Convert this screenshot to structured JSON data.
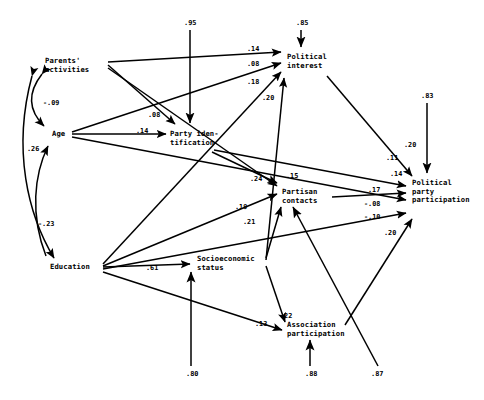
{
  "figure": {
    "type": "path-diagram",
    "title": "",
    "background_color": "#ffffff",
    "line_color": "#000000",
    "text_color": "#000000"
  },
  "nodes": [
    {
      "id": "parents_activities",
      "label": "Parents'\nactivities",
      "x": 45,
      "y": 58
    },
    {
      "id": "age",
      "label": "Age",
      "x": 52,
      "y": 131
    },
    {
      "id": "education",
      "label": "Education",
      "x": 50,
      "y": 264
    },
    {
      "id": "party_identification",
      "label": "Party iden-\ntification",
      "x": 168,
      "y": 131
    },
    {
      "id": "political_interest",
      "label": "Political\ninterest",
      "x": 287,
      "y": 54
    },
    {
      "id": "partisan_contacts",
      "label": "Partisan\ncontacts",
      "x": 281,
      "y": 189
    },
    {
      "id": "socioeconomic_status",
      "label": "Socioeconomic\nstatus",
      "x": 196,
      "y": 255
    },
    {
      "id": "association_participation",
      "label": "Association\nparticipation",
      "x": 286,
      "y": 322
    },
    {
      "id": "political_party_participation",
      "label": "Political\nparty\nparticipation",
      "x": 411,
      "y": 180
    }
  ],
  "coefficients": [
    {
      "id": "c-parents-interest",
      "value": ".14",
      "x": 247,
      "y": 47
    },
    {
      "id": "c-age-interest",
      "value": ".08",
      "x": 247,
      "y": 62
    },
    {
      "id": "c-education-interest",
      "value": ".18",
      "x": 247,
      "y": 80
    },
    {
      "id": "c-ses-interest",
      "value": ".20",
      "x": 262,
      "y": 96
    },
    {
      "id": "c-parents-partyid",
      "value": ".08",
      "x": 148,
      "y": 113
    },
    {
      "id": "c-age-partyid",
      "value": ".14",
      "x": 136,
      "y": 129
    },
    {
      "id": "c-partyid-contacts",
      "value": ".24",
      "x": 250,
      "y": 177
    },
    {
      "id": "c-parents-contacts",
      "value": ".15",
      "x": 286,
      "y": 174
    },
    {
      "id": "c-education-contacts",
      "value": ".19",
      "x": 235,
      "y": 205
    },
    {
      "id": "c-ses-contacts",
      "value": ".21",
      "x": 243,
      "y": 220
    },
    {
      "id": "c-education-ses",
      "value": ".61",
      "x": 146,
      "y": 266
    },
    {
      "id": "c-ses-assoc",
      "value": ".22",
      "x": 280,
      "y": 314
    },
    {
      "id": "c-education-assoc",
      "value": ".13",
      "x": 255,
      "y": 322
    },
    {
      "id": "c-interest-ppp",
      "value": ".20",
      "x": 404,
      "y": 143
    },
    {
      "id": "c-partyid-ppp",
      "value": ".11",
      "x": 386,
      "y": 156
    },
    {
      "id": "c-contacts-ppp-a",
      "value": ".14",
      "x": 390,
      "y": 172
    },
    {
      "id": "c-contacts-ppp-b",
      "value": ".17",
      "x": 368,
      "y": 188
    },
    {
      "id": "c-age-ppp",
      "value": "-.08",
      "x": 364,
      "y": 202
    },
    {
      "id": "c-education-ppp",
      "value": "-.10",
      "x": 364,
      "y": 215
    },
    {
      "id": "c-assoc-ppp",
      "value": ".20",
      "x": 384,
      "y": 231
    },
    {
      "id": "corr-parents-age",
      "value": "-.09",
      "x": 43,
      "y": 101
    },
    {
      "id": "corr-age-education",
      "value": ".26",
      "x": 27,
      "y": 147
    },
    {
      "id": "corr-parents-education",
      "value": "-.23",
      "x": 38,
      "y": 222
    }
  ],
  "disturbances": [
    {
      "id": "d-partyid",
      "value": ".95",
      "x": 184,
      "y": 21
    },
    {
      "id": "d-interest",
      "value": ".85",
      "x": 296,
      "y": 21
    },
    {
      "id": "d-ppp",
      "value": ".83",
      "x": 421,
      "y": 94
    },
    {
      "id": "d-ses",
      "value": ".80",
      "x": 186,
      "y": 372
    },
    {
      "id": "d-assoc",
      "value": ".88",
      "x": 305,
      "y": 372
    },
    {
      "id": "d-contacts",
      "value": ".87",
      "x": 371,
      "y": 372
    }
  ],
  "edges": [
    {
      "id": "e-parents-interest",
      "from": "parents_activities",
      "to": "political_interest",
      "coef": ".14"
    },
    {
      "id": "e-age-interest",
      "from": "age",
      "to": "political_interest",
      "coef": ".08"
    },
    {
      "id": "e-education-interest",
      "from": "education",
      "to": "political_interest",
      "coef": ".18"
    },
    {
      "id": "e-ses-interest",
      "from": "socioeconomic_status",
      "to": "political_interest",
      "coef": ".20"
    },
    {
      "id": "e-parents-partyid",
      "from": "parents_activities",
      "to": "party_identification",
      "coef": ".08"
    },
    {
      "id": "e-age-partyid",
      "from": "age",
      "to": "party_identification",
      "coef": ".14"
    },
    {
      "id": "e-partyid-contacts",
      "from": "party_identification",
      "to": "partisan_contacts",
      "coef": ".24"
    },
    {
      "id": "e-parents-contacts",
      "from": "parents_activities",
      "to": "partisan_contacts",
      "coef": ".15"
    },
    {
      "id": "e-education-contacts",
      "from": "education",
      "to": "partisan_contacts",
      "coef": ".19"
    },
    {
      "id": "e-ses-contacts",
      "from": "socioeconomic_status",
      "to": "partisan_contacts",
      "coef": ".21"
    },
    {
      "id": "e-education-ses",
      "from": "education",
      "to": "socioeconomic_status",
      "coef": ".61"
    },
    {
      "id": "e-ses-assoc",
      "from": "socioeconomic_status",
      "to": "association_participation",
      "coef": ".22"
    },
    {
      "id": "e-education-assoc",
      "from": "education",
      "to": "association_participation",
      "coef": ".13"
    },
    {
      "id": "e-interest-ppp",
      "from": "political_interest",
      "to": "political_party_participation",
      "coef": ".20"
    },
    {
      "id": "e-partyid-ppp",
      "from": "party_identification",
      "to": "political_party_participation",
      "coef": ".11"
    },
    {
      "id": "e-contacts-ppp-a",
      "from": "partisan_contacts",
      "to": "political_party_participation",
      "coef": ".14"
    },
    {
      "id": "e-contacts-ppp-b",
      "from": "partisan_contacts",
      "to": "political_party_participation",
      "coef": ".17"
    },
    {
      "id": "e-age-ppp",
      "from": "age",
      "to": "political_party_participation",
      "coef": "-.08"
    },
    {
      "id": "e-education-ppp",
      "from": "education",
      "to": "political_party_participation",
      "coef": "-.10"
    },
    {
      "id": "e-assoc-ppp",
      "from": "association_participation",
      "to": "political_party_participation",
      "coef": ".20"
    }
  ],
  "correlations": [
    {
      "id": "r-parents-age",
      "between": [
        "parents_activities",
        "age"
      ],
      "value": "-.09"
    },
    {
      "id": "r-age-education",
      "between": [
        "age",
        "education"
      ],
      "value": ".26"
    },
    {
      "id": "r-parents-education",
      "between": [
        "parents_activities",
        "education"
      ],
      "value": "-.23"
    }
  ]
}
